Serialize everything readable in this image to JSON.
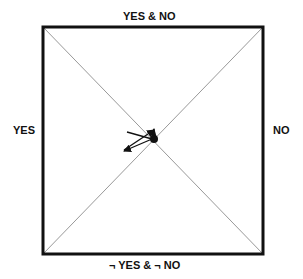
{
  "labels": {
    "top": "YES & NO",
    "bottom": "¬ YES & ¬ NO",
    "left": "YES",
    "right": "NO"
  },
  "colors": {
    "frame": "#111111",
    "diagonal": "#999999",
    "arrow": "#111111"
  }
}
